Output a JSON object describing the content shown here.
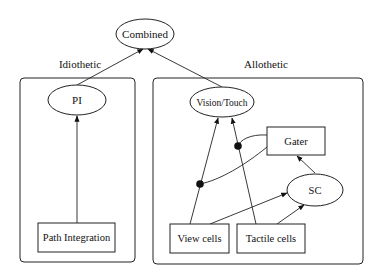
{
  "diagram": {
    "type": "block-diagram",
    "nodes": {
      "combined": {
        "label": "Combined",
        "shape": "ellipse"
      },
      "pi": {
        "label": "PI",
        "shape": "ellipse"
      },
      "path_integration": {
        "label": "Path Integration",
        "shape": "rect"
      },
      "vision_touch": {
        "label": "Vision/Touch",
        "shape": "ellipse"
      },
      "gater": {
        "label": "Gater",
        "shape": "rect"
      },
      "sc": {
        "label": "SC",
        "shape": "ellipse"
      },
      "view_cells": {
        "label": "View cells",
        "shape": "rect"
      },
      "tactile_cells": {
        "label": "Tactile cells",
        "shape": "rect"
      }
    },
    "groups": {
      "idiothetic": {
        "label": "Idiothetic",
        "contains": [
          "pi",
          "path_integration"
        ]
      },
      "allothetic": {
        "label": "Allothetic",
        "contains": [
          "vision_touch",
          "gater",
          "sc",
          "view_cells",
          "tactile_cells"
        ]
      }
    },
    "edges": [
      {
        "from": "pi",
        "to": "combined",
        "type": "arrow"
      },
      {
        "from": "vision_touch",
        "to": "combined",
        "type": "arrow"
      },
      {
        "from": "path_integration",
        "to": "pi",
        "type": "arrow"
      },
      {
        "from": "view_cells",
        "to": "vision_touch",
        "type": "arrow"
      },
      {
        "from": "tactile_cells",
        "to": "vision_touch",
        "type": "arrow"
      },
      {
        "from": "view_cells",
        "to": "sc",
        "type": "arrow"
      },
      {
        "from": "tactile_cells",
        "to": "sc",
        "type": "arrow"
      },
      {
        "from": "sc",
        "to": "gater",
        "type": "arrow"
      },
      {
        "from": "gater",
        "to": "view_cells_edge",
        "type": "gating-dot"
      },
      {
        "from": "gater",
        "to": "tactile_cells_edge",
        "type": "gating-dot"
      }
    ]
  }
}
